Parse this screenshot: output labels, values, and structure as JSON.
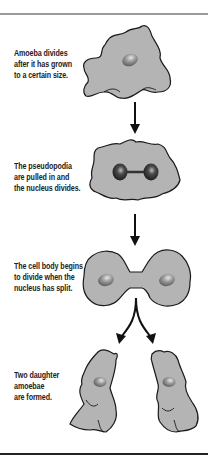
{
  "steps": [
    {
      "id": "grown",
      "lines": [
        "Amoeba divides",
        "after it has grown",
        "to a certain size."
      ]
    },
    {
      "id": "nucleus-divides",
      "lines": [
        "The pseudopodia",
        "are pulled in and",
        "the nucleus divides."
      ]
    },
    {
      "id": "body-divides",
      "lines": [
        "The cell body begins",
        "to divide when the",
        "nucleus has split."
      ]
    },
    {
      "id": "daughters",
      "lines": [
        "Two daughter",
        "amoebae",
        "are formed."
      ]
    }
  ],
  "colors": {
    "cell_fill": "#b4b4b4",
    "cell_outline": "#1a1a1a",
    "nucleus": "#7a7a7a",
    "arrow": "#111111"
  }
}
